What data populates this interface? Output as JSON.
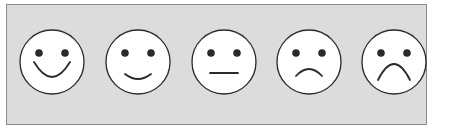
{
  "scale": {
    "label": "Five-point smiley face rating scale",
    "faces": [
      {
        "name": "very-happy",
        "cx": 52,
        "mouth": "M 34 62 Q 52 92 70 62"
      },
      {
        "name": "happy",
        "cx": 138,
        "mouth": "M 125 74 Q 138 84 151 74"
      },
      {
        "name": "neutral",
        "cx": 224,
        "mouth": "M 210 73 L 238 73"
      },
      {
        "name": "sad",
        "cx": 309,
        "mouth": "M 296 76 Q 309 62 322 76"
      },
      {
        "name": "very-sad",
        "cx": 394,
        "mouth": "M 378 80 Q 394 48 410 80"
      }
    ],
    "cy": 62,
    "radius": 32,
    "eye_offset_x": 13,
    "eye_offset_y": -9,
    "eye_radius": 3.8
  },
  "colors": {
    "panel": "#dcdcdc",
    "face": "#ffffff",
    "stroke": "#2a2a2a"
  }
}
